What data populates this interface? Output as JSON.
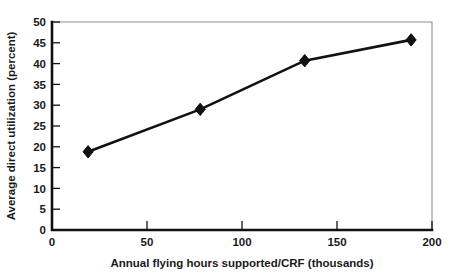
{
  "chart_data": {
    "type": "line",
    "title": "",
    "xlabel": "Annual flying hours supported/CRF (thousands)",
    "ylabel": "Average direct utilization (percent)",
    "xlim": [
      0,
      200
    ],
    "ylim": [
      0,
      50
    ],
    "grid": false,
    "legend": null,
    "x": [
      19,
      78,
      133,
      189
    ],
    "values": [
      18.8,
      29.0,
      40.7,
      45.7
    ],
    "series": [
      {
        "name": "Average direct utilization",
        "x": [
          19,
          78,
          133,
          189
        ],
        "values": [
          18.8,
          29.0,
          40.7,
          45.7
        ],
        "marker": "diamond",
        "color": "#111111"
      }
    ],
    "xticks": [
      0,
      50,
      100,
      150,
      200
    ],
    "xtick_labels": [
      "0",
      "50",
      "100",
      "150",
      "200"
    ],
    "yticks": [
      0,
      5,
      10,
      15,
      20,
      25,
      30,
      35,
      40,
      45,
      50
    ],
    "ytick_labels": [
      "0",
      "5",
      "10",
      "15",
      "20",
      "25",
      "30",
      "35",
      "40",
      "45",
      "50"
    ],
    "annotations": []
  },
  "axes": {
    "x_title": "Annual flying hours supported/CRF (thousands)",
    "y_title": "Average direct utilization (percent)"
  },
  "ticks": {
    "x": [
      "0",
      "50",
      "100",
      "150",
      "200"
    ],
    "y": [
      "0",
      "5",
      "10",
      "15",
      "20",
      "25",
      "30",
      "35",
      "40",
      "45",
      "50"
    ]
  },
  "colors": {
    "series": "#111111",
    "axis_heavy": "#111111",
    "axis_light": "#8f8f8f",
    "background": "#ffffff",
    "text": "#1a1a1a"
  }
}
